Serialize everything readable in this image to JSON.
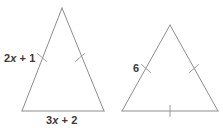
{
  "figure": {
    "type": "geometry-diagram",
    "canvas": {
      "width": 223,
      "height": 133,
      "background": "#ffffff"
    },
    "stroke_color": "#8d8d8d",
    "tick_color": "#9a9a9a",
    "text_color": "#3a3a3a",
    "triangles": [
      {
        "id": "triangle-left",
        "name": "left-triangle",
        "apex": {
          "x": 62,
          "y": 8
        },
        "base_left": {
          "x": 22,
          "y": 111
        },
        "base_right": {
          "x": 104,
          "y": 111
        },
        "leg_tick_count": 1,
        "base_tick_count": 0,
        "labels": {
          "left_leg": "2x + 1",
          "base": "3x + 2"
        }
      },
      {
        "id": "triangle-right",
        "name": "right-triangle",
        "apex": {
          "x": 170,
          "y": 25
        },
        "base_left": {
          "x": 122,
          "y": 111
        },
        "base_right": {
          "x": 218,
          "y": 111
        },
        "leg_tick_count": 1,
        "base_tick_count": 1,
        "labels": {
          "left_leg": "6"
        }
      }
    ]
  },
  "labels": {
    "left_triangle_leg": {
      "coefficient": "2",
      "variable": "x",
      "operator": "+",
      "constant": "1"
    },
    "left_triangle_base": {
      "coefficient": "3",
      "variable": "x",
      "operator": "+",
      "constant": "2"
    },
    "right_triangle_leg": {
      "value": "6"
    }
  }
}
